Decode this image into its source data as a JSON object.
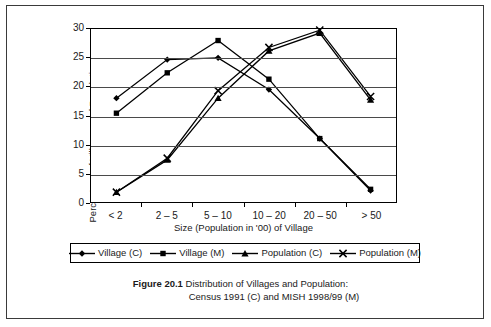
{
  "figure": {
    "number_label": "Figure 20.1",
    "caption_line1": "Distribution of Villages and Population:",
    "caption_line2": "Census 1991 (C) and MISH 1998/99 (M)"
  },
  "axes": {
    "y_title": "Percentage of Villages and Population",
    "x_title": "Size (Population in '00) of Village",
    "y_ticks": [
      "0",
      "5",
      "10",
      "15",
      "20",
      "25",
      "30"
    ],
    "x_ticks": [
      "< 2",
      "2 – 5",
      "5 – 10",
      "10 – 20",
      "20 – 50",
      "> 50"
    ]
  },
  "legend": {
    "items": [
      {
        "label": "Village (C)",
        "marker": "diamond"
      },
      {
        "label": "Village (M)",
        "marker": "square"
      },
      {
        "label": "Population (C)",
        "marker": "triangle"
      },
      {
        "label": "Population (M)",
        "marker": "cross"
      }
    ]
  },
  "colors": {
    "line": "#000000",
    "grid": "#4a4a4a",
    "frame": "#3a3a3a",
    "background": "#ffffff"
  },
  "chart_data": {
    "type": "line",
    "title": "Distribution of Villages and Population: Census 1991 (C) and MISH 1998/99 (M)",
    "xlabel": "Size (Population in '00) of Village",
    "ylabel": "Percentage of Villages and Population",
    "categories": [
      "< 2",
      "2 – 5",
      "5 – 10",
      "10 – 20",
      "20 – 50",
      "> 50"
    ],
    "ylim": [
      0,
      30
    ],
    "ytick_step": 5,
    "grid": true,
    "legend_position": "bottom",
    "series": [
      {
        "name": "Village (C)",
        "marker": "diamond",
        "values": [
          18.0,
          24.7,
          25.0,
          19.5,
          11.0,
          2.0
        ]
      },
      {
        "name": "Village (M)",
        "marker": "square",
        "values": [
          15.4,
          22.4,
          28.0,
          21.3,
          11.0,
          2.2
        ]
      },
      {
        "name": "Population (C)",
        "marker": "triangle",
        "values": [
          1.7,
          7.3,
          18.0,
          26.2,
          29.3,
          17.7
        ]
      },
      {
        "name": "Population (M)",
        "marker": "cross",
        "values": [
          1.7,
          7.6,
          19.3,
          26.8,
          29.8,
          18.3
        ]
      }
    ]
  }
}
